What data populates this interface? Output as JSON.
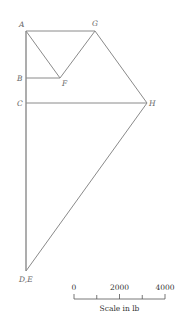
{
  "diagram": {
    "type": "force polygon",
    "points": {
      "A": {
        "label": "A",
        "x": 26,
        "y": 31
      },
      "G": {
        "label": "G",
        "x": 95,
        "y": 31
      },
      "B": {
        "label": "B",
        "x": 26,
        "y": 78
      },
      "F": {
        "label": "F",
        "x": 60,
        "y": 78
      },
      "C": {
        "label": "C",
        "x": 26,
        "y": 103
      },
      "H": {
        "label": "H",
        "x": 147,
        "y": 103
      },
      "DE": {
        "label": "D,E",
        "x": 26,
        "y": 271
      }
    },
    "line_color": "#8a8a8a"
  },
  "scale": {
    "ticks": [
      "0",
      "2000",
      "4000"
    ],
    "caption": "Scale in lb"
  }
}
